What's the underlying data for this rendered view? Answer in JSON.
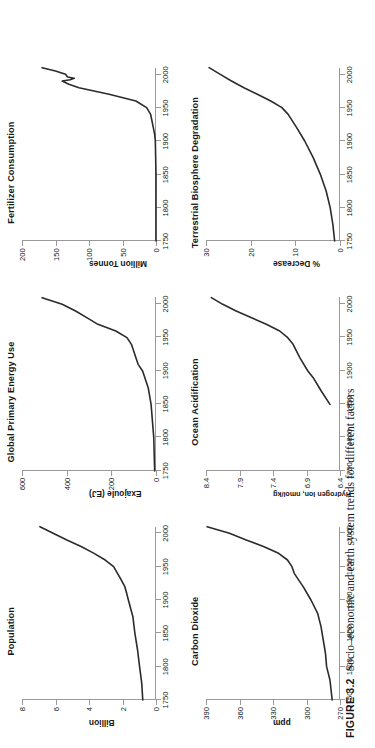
{
  "caption": {
    "label": "FIGURE 3.2",
    "text": "Socio–economic and earth system trends for different factors"
  },
  "chart_data": [
    {
      "id": "population",
      "type": "line",
      "title": "Population",
      "xlabel": "",
      "ylabel": "Billion",
      "xlim": [
        1750,
        2010
      ],
      "ylim": [
        0,
        8
      ],
      "xticks": [
        1750,
        1800,
        1850,
        1900,
        1950,
        2000
      ],
      "yticks": [
        0,
        2,
        4,
        6,
        8
      ],
      "grid": false,
      "x": [
        1750,
        1775,
        1800,
        1825,
        1850,
        1875,
        1900,
        1910,
        1920,
        1930,
        1940,
        1950,
        1960,
        1970,
        1980,
        1990,
        2000,
        2010
      ],
      "y": [
        0.79,
        0.85,
        0.98,
        1.1,
        1.26,
        1.38,
        1.65,
        1.75,
        1.86,
        2.07,
        2.3,
        2.53,
        3.03,
        3.7,
        4.44,
        5.32,
        6.14,
        6.93
      ]
    },
    {
      "id": "global-primary-energy-use",
      "type": "line",
      "title": "Global Primary Energy Use",
      "xlabel": "",
      "ylabel": "Exajoule (EJ)",
      "xlim": [
        1750,
        2010
      ],
      "ylim": [
        0,
        600
      ],
      "xticks": [
        1750,
        1800,
        1850,
        1900,
        1950,
        2000
      ],
      "yticks": [
        0,
        200,
        400,
        600
      ],
      "grid": false,
      "x": [
        1750,
        1800,
        1850,
        1875,
        1900,
        1910,
        1920,
        1930,
        1940,
        1950,
        1960,
        1970,
        1980,
        1990,
        2000,
        2010
      ],
      "y": [
        6,
        10,
        22,
        35,
        60,
        80,
        90,
        100,
        110,
        130,
        180,
        260,
        310,
        360,
        420,
        510
      ]
    },
    {
      "id": "fertilizer-consumption",
      "type": "line",
      "title": "Fertilizer Consumption",
      "xlabel": "",
      "ylabel": "Million Tonnes",
      "xlim": [
        1750,
        2010
      ],
      "ylim": [
        0,
        200
      ],
      "xticks": [
        1750,
        1800,
        1850,
        1900,
        1950,
        2000
      ],
      "yticks": [
        0,
        50,
        100,
        150,
        200
      ],
      "grid": false,
      "x": [
        1750,
        1850,
        1900,
        1910,
        1920,
        1930,
        1940,
        1950,
        1960,
        1970,
        1980,
        1985,
        1990,
        1992,
        1994,
        1996,
        2000,
        2005,
        2010
      ],
      "y": [
        0,
        0,
        1,
        2,
        4,
        6,
        8,
        14,
        30,
        70,
        115,
        130,
        140,
        128,
        122,
        132,
        135,
        150,
        170
      ]
    },
    {
      "id": "carbon-dioxide",
      "type": "line",
      "title": "Carbon Dioxide",
      "xlabel": "",
      "ylabel": "ppm",
      "xlim": [
        1750,
        2010
      ],
      "ylim": [
        270,
        390
      ],
      "xticks": [
        1750,
        1800,
        1850,
        1900,
        1950,
        2000
      ],
      "yticks": [
        270,
        300,
        330,
        360,
        390
      ],
      "grid": false,
      "x": [
        1750,
        1780,
        1800,
        1820,
        1840,
        1860,
        1880,
        1900,
        1920,
        1940,
        1950,
        1960,
        1970,
        1980,
        1990,
        2000,
        2010
      ],
      "y": [
        277,
        279,
        282,
        283,
        285,
        287,
        290,
        296,
        303,
        311,
        313,
        317,
        325,
        338,
        354,
        369,
        389
      ]
    },
    {
      "id": "ocean-acidification",
      "type": "line",
      "title": "Ocean Acidification",
      "xlabel": "",
      "ylabel": "Hydrogen Ion, nmol/kg",
      "xlim": [
        1750,
        2010
      ],
      "ylim": [
        6.4,
        8.4
      ],
      "xticks": [
        1750,
        1800,
        1850,
        1900,
        1950,
        2000
      ],
      "yticks": [
        6.4,
        6.9,
        7.4,
        7.9,
        8.4
      ],
      "grid": false,
      "x": [
        1850,
        1870,
        1890,
        1900,
        1920,
        1940,
        1950,
        1960,
        1970,
        1980,
        1990,
        2000,
        2010
      ],
      "y": [
        6.55,
        6.68,
        6.8,
        6.88,
        7.0,
        7.1,
        7.18,
        7.3,
        7.5,
        7.72,
        7.95,
        8.15,
        8.32
      ]
    },
    {
      "id": "terrestrial-biosphere-degradation",
      "type": "line",
      "title": "Terrestrial Biosphere Degradation",
      "xlabel": "",
      "ylabel": "% Decrease",
      "xlim": [
        1750,
        2010
      ],
      "ylim": [
        0,
        30
      ],
      "xticks": [
        1750,
        1800,
        1850,
        1900,
        1950,
        2000
      ],
      "yticks": [
        0,
        10,
        20,
        30
      ],
      "grid": false,
      "x": [
        1750,
        1775,
        1800,
        1825,
        1850,
        1875,
        1900,
        1920,
        1940,
        1950,
        1960,
        1970,
        1980,
        1990,
        2000,
        2010
      ],
      "y": [
        1.2,
        1.6,
        2.2,
        3.1,
        4.4,
        6.0,
        7.9,
        9.7,
        11.6,
        13.0,
        15.5,
        18.5,
        21.5,
        24.3,
        26.8,
        29.3
      ]
    }
  ]
}
